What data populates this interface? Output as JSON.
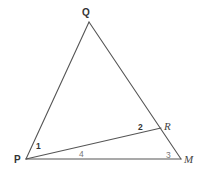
{
  "diagram": {
    "type": "geometry-triangle",
    "points": {
      "Q": {
        "label": "Q",
        "x": 89,
        "y": 22
      },
      "P": {
        "label": "P",
        "x": 26,
        "y": 159
      },
      "M": {
        "label": "M",
        "x": 181,
        "y": 159
      },
      "R": {
        "label": "R",
        "x": 161,
        "y": 128
      }
    },
    "segments": [
      {
        "from": "P",
        "to": "Q"
      },
      {
        "from": "Q",
        "to": "M"
      },
      {
        "from": "P",
        "to": "M"
      },
      {
        "from": "P",
        "to": "R"
      }
    ],
    "vertex_labels": {
      "Q": "Q",
      "P": "P",
      "R": "R",
      "M": "M"
    },
    "angle_labels": {
      "a1": "1",
      "a2": "2",
      "a3": "3",
      "a4": "4"
    },
    "colors": {
      "line": "#555555",
      "text": "#333333"
    }
  }
}
